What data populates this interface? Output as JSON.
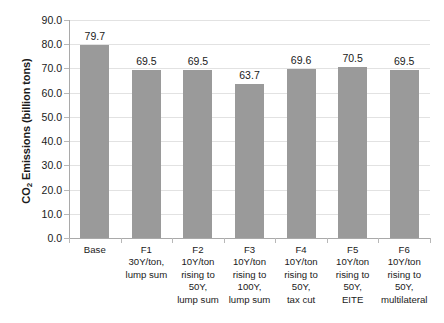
{
  "chart_data": {
    "type": "bar",
    "title": "",
    "xlabel": "",
    "ylabel": "CO2 Emissions (billion tons)",
    "ylabel_parts": {
      "prefix": "CO",
      "subscript": "2",
      "suffix": " Emissions (billion tons)"
    },
    "categories": [
      "Base",
      "F1 30Y/ton, lump sum",
      "F2 10Y/ton rising to 50Y, lump sum",
      "F3 10Y/ton rising to 100Y, lump sum",
      "F4 10Y/ton rising to 50Y, tax cut",
      "F5 10Y/ton rising to 50Y, EITE",
      "F6 10Y/ton rising to 50Y, multilateral"
    ],
    "category_lines": [
      [
        "Base"
      ],
      [
        "F1",
        "30Y/ton,",
        "lump sum"
      ],
      [
        "F2",
        "10Y/ton",
        "rising to",
        "50Y,",
        "lump sum"
      ],
      [
        "F3",
        "10Y/ton",
        "rising to",
        "100Y,",
        "lump sum"
      ],
      [
        "F4",
        "10Y/ton",
        "rising to",
        "50Y,",
        "tax cut"
      ],
      [
        "F5",
        "10Y/ton",
        "rising to",
        "50Y,",
        "EITE"
      ],
      [
        "F6",
        "10Y/ton",
        "rising to",
        "50Y,",
        "multilateral"
      ]
    ],
    "values": [
      79.7,
      69.5,
      69.5,
      63.7,
      69.6,
      70.5,
      69.5
    ],
    "value_labels": [
      "79.7",
      "69.5",
      "69.5",
      "63.7",
      "69.6",
      "70.5",
      "69.5"
    ],
    "ylim": [
      0,
      90
    ],
    "ytick_step": 10,
    "ytick_labels": [
      "0.0",
      "10.0",
      "20.0",
      "30.0",
      "40.0",
      "50.0",
      "60.0",
      "70.0",
      "80.0",
      "90.0"
    ],
    "ytick_values": [
      0,
      10,
      20,
      30,
      40,
      50,
      60,
      70,
      80,
      90
    ],
    "grid": true,
    "grid_axis": "y",
    "legend": false,
    "legend_position": "none",
    "colors": {
      "bar": "#9a9a9a",
      "gridline": "#e2e2e2",
      "axis": "#a9a9a9",
      "text": "#1a1a1a",
      "background": "#ffffff"
    }
  }
}
